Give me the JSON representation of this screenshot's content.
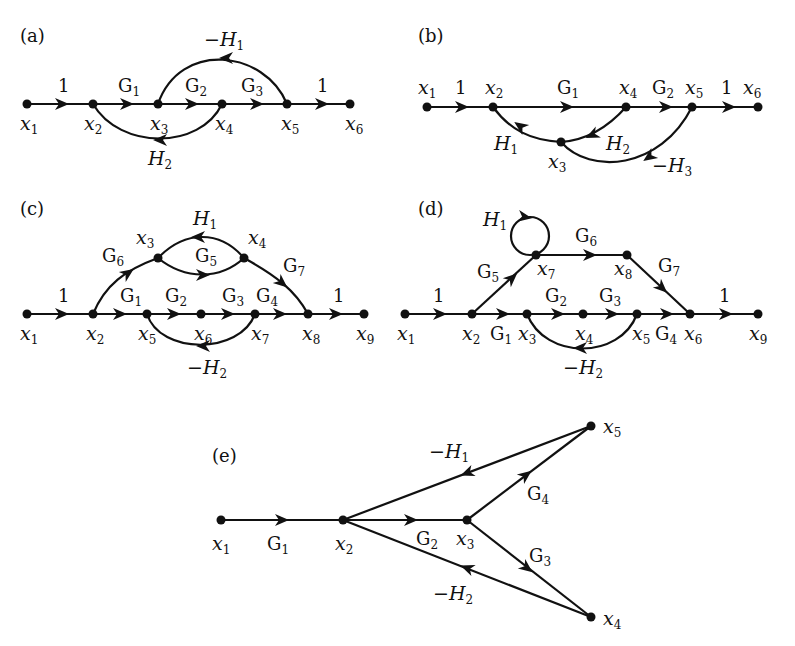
{
  "panels": [
    {
      "id": "a",
      "label": "(a)",
      "nodes": [
        "x1",
        "x2",
        "x3",
        "x4",
        "x5",
        "x6"
      ],
      "edges": [
        {
          "from": "x1",
          "to": "x2",
          "gain": "1"
        },
        {
          "from": "x2",
          "to": "x3",
          "gain": "G1"
        },
        {
          "from": "x3",
          "to": "x4",
          "gain": "G2"
        },
        {
          "from": "x4",
          "to": "x5",
          "gain": "G3"
        },
        {
          "from": "x5",
          "to": "x6",
          "gain": "1"
        },
        {
          "from": "x5",
          "to": "x3",
          "gain": "-H1"
        },
        {
          "from": "x4",
          "to": "x2",
          "gain": "H2"
        }
      ]
    },
    {
      "id": "b",
      "label": "(b)",
      "nodes": [
        "x1",
        "x2",
        "x3",
        "x4",
        "x5",
        "x6"
      ],
      "edges": [
        {
          "from": "x1",
          "to": "x2",
          "gain": "1"
        },
        {
          "from": "x2",
          "to": "x4",
          "gain": "G1"
        },
        {
          "from": "x4",
          "to": "x5",
          "gain": "G2"
        },
        {
          "from": "x5",
          "to": "x6",
          "gain": "1"
        },
        {
          "from": "x4",
          "to": "x3",
          "gain": "H2"
        },
        {
          "from": "x3",
          "to": "x2",
          "gain": "H1"
        },
        {
          "from": "x5",
          "to": "x3",
          "gain": "-H3"
        }
      ]
    },
    {
      "id": "c",
      "label": "(c)",
      "nodes": [
        "x1",
        "x2",
        "x3",
        "x4",
        "x5",
        "x6",
        "x7",
        "x8",
        "x9"
      ],
      "edges": [
        {
          "from": "x1",
          "to": "x2",
          "gain": "1"
        },
        {
          "from": "x2",
          "to": "x5",
          "gain": "G1"
        },
        {
          "from": "x5",
          "to": "x6",
          "gain": "G2"
        },
        {
          "from": "x6",
          "to": "x7",
          "gain": "G3"
        },
        {
          "from": "x7",
          "to": "x8",
          "gain": "G4"
        },
        {
          "from": "x8",
          "to": "x9",
          "gain": "1"
        },
        {
          "from": "x2",
          "to": "x3",
          "gain": "G6"
        },
        {
          "from": "x3",
          "to": "x4",
          "gain": "G5"
        },
        {
          "from": "x4",
          "to": "x3",
          "gain": "H1"
        },
        {
          "from": "x4",
          "to": "x8",
          "gain": "G7"
        },
        {
          "from": "x7",
          "to": "x5",
          "gain": "-H2"
        }
      ]
    },
    {
      "id": "d",
      "label": "(d)",
      "nodes": [
        "x1",
        "x2",
        "x3",
        "x4",
        "x5",
        "x6",
        "x7",
        "x8",
        "x9"
      ],
      "edges": [
        {
          "from": "x1",
          "to": "x2",
          "gain": "1"
        },
        {
          "from": "x2",
          "to": "x3",
          "gain": "G1"
        },
        {
          "from": "x3",
          "to": "x4",
          "gain": "G2"
        },
        {
          "from": "x4",
          "to": "x5",
          "gain": "G3"
        },
        {
          "from": "x5",
          "to": "x6",
          "gain": "G4"
        },
        {
          "from": "x6",
          "to": "x9",
          "gain": "1"
        },
        {
          "from": "x2",
          "to": "x7",
          "gain": "G5"
        },
        {
          "from": "x7",
          "to": "x7",
          "gain": "H1"
        },
        {
          "from": "x7",
          "to": "x8",
          "gain": "G6"
        },
        {
          "from": "x8",
          "to": "x6",
          "gain": "G7"
        },
        {
          "from": "x5",
          "to": "x3",
          "gain": "-H2"
        }
      ]
    },
    {
      "id": "e",
      "label": "(e)",
      "nodes": [
        "x1",
        "x2",
        "x3",
        "x4",
        "x5"
      ],
      "edges": [
        {
          "from": "x1",
          "to": "x2",
          "gain": "G1"
        },
        {
          "from": "x2",
          "to": "x3",
          "gain": "G2"
        },
        {
          "from": "x3",
          "to": "x4",
          "gain": "G3"
        },
        {
          "from": "x3",
          "to": "x5",
          "gain": "G4"
        },
        {
          "from": "x5",
          "to": "x2",
          "gain": "-H1"
        },
        {
          "from": "x4",
          "to": "x2",
          "gain": "-H2"
        }
      ]
    }
  ],
  "labels": {
    "a": {
      "panel": "(a)",
      "x1": "x",
      "x2": "x",
      "x3": "x",
      "x4": "x",
      "x5": "x",
      "x6": "x",
      "one_a": "1",
      "one_b": "1",
      "g1": "G",
      "g2": "G",
      "g3": "G",
      "h1": "−H",
      "h2": "H"
    },
    "b": {
      "panel": "(b)",
      "x": "x",
      "one_a": "1",
      "one_b": "1",
      "g1": "G",
      "g2": "G",
      "h1": "H",
      "h2": "H",
      "h3": "−H"
    },
    "c": {
      "panel": "(c)",
      "x": "x",
      "one_a": "1",
      "one_b": "1",
      "g": "G",
      "h1": "H",
      "h2": "−H"
    },
    "d": {
      "panel": "(d)",
      "x": "x",
      "one_a": "1",
      "one_b": "1",
      "g": "G",
      "h1": "H",
      "h2": "−H"
    },
    "e": {
      "panel": "(e)",
      "x": "x",
      "g": "G",
      "h1": "−H",
      "h2": "−H"
    }
  },
  "subscripts": [
    "1",
    "2",
    "3",
    "4",
    "5",
    "6",
    "7",
    "8",
    "9"
  ]
}
